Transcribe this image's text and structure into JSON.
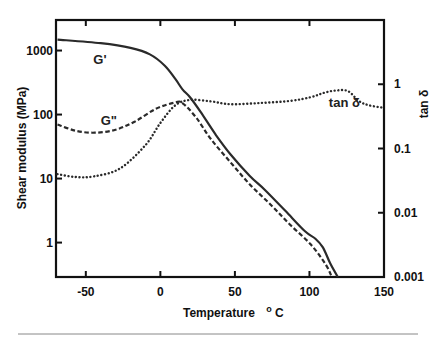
{
  "chart_data": {
    "type": "line",
    "title": "",
    "xlabel": "Temperature",
    "xlabel_unit_sup": "o",
    "xlabel_unit": "C",
    "ylabel": "Shear modulus  (MPa)",
    "y2label": "tan δ",
    "xlim": [
      -70,
      150
    ],
    "ylim": [
      0.29,
      3000
    ],
    "y2lim": [
      0.001,
      10
    ],
    "yscale": "log",
    "y2scale": "log",
    "grid": false,
    "legend": "inline labels",
    "x_ticks": [
      {
        "value": -50,
        "label": "-50"
      },
      {
        "value": 0,
        "label": "0"
      },
      {
        "value": 50,
        "label": "50"
      },
      {
        "value": 100,
        "label": "100"
      },
      {
        "value": 150,
        "label": "150"
      }
    ],
    "y_ticks": [
      {
        "value": 1,
        "label": "1"
      },
      {
        "value": 10,
        "label": "10"
      },
      {
        "value": 100,
        "label": "100"
      },
      {
        "value": 1000,
        "label": "1000"
      }
    ],
    "y2_ticks": [
      {
        "value": 0.001,
        "label": "0.001"
      },
      {
        "value": 0.01,
        "label": "0.01"
      },
      {
        "value": 0.1,
        "label": "0.1"
      },
      {
        "value": 1,
        "label": "1"
      }
    ],
    "series": [
      {
        "name": "G'",
        "axis": "left",
        "style": "solid",
        "label_pos": {
          "x": -45,
          "y": 620
        },
        "x": [
          -69,
          -40,
          -20,
          -7,
          3,
          10,
          15,
          20,
          27,
          37,
          47,
          60,
          70,
          84,
          97,
          104,
          109,
          114,
          119
        ],
        "values": [
          1480,
          1300,
          1100,
          870,
          580,
          360,
          245,
          185,
          110,
          49,
          24,
          11,
          6.7,
          3.1,
          1.5,
          1.15,
          0.84,
          0.47,
          0.29
        ]
      },
      {
        "name": "G\"",
        "axis": "left",
        "style": "dashed",
        "label_pos": {
          "x": -40,
          "y": 68
        },
        "x": [
          -69,
          -57,
          -44,
          -30,
          -17,
          -3,
          10,
          15,
          24,
          34,
          47,
          60,
          74,
          87,
          101,
          111,
          115
        ],
        "values": [
          70,
          56,
          52,
          58,
          78,
          123,
          155,
          150,
          90,
          41,
          18,
          8.1,
          3.9,
          1.9,
          0.93,
          0.45,
          0.29
        ]
      },
      {
        "name": "tan δ",
        "axis": "right",
        "style": "dotted",
        "label_pos": {
          "x": 113,
          "y": 0.45
        },
        "x": [
          -69,
          -57,
          -44,
          -27,
          -10,
          0,
          10,
          20,
          34,
          47,
          67,
          87,
          101,
          110,
          118,
          126,
          133,
          140,
          150
        ],
        "values": [
          0.04,
          0.036,
          0.037,
          0.049,
          0.113,
          0.25,
          0.47,
          0.57,
          0.54,
          0.49,
          0.51,
          0.55,
          0.63,
          0.74,
          0.8,
          0.78,
          0.55,
          0.47,
          0.43
        ]
      }
    ]
  }
}
